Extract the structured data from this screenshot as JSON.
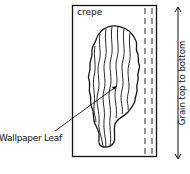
{
  "diagram": {
    "paper_label": "crepe",
    "leaf_label": "Wallpaper Leaf",
    "grain_label": "Grain top to bottom"
  },
  "colors": {
    "ink": "#111111",
    "background": "#ffffff"
  }
}
